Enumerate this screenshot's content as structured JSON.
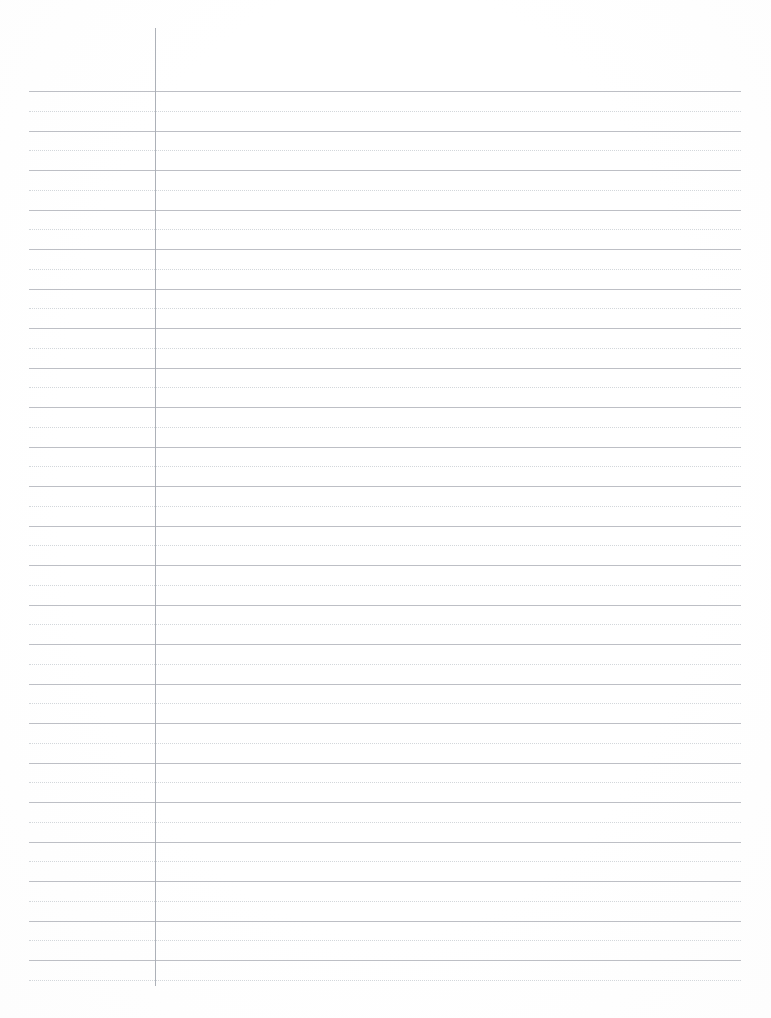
{
  "document": {
    "title": "Ruled Notebook Paper",
    "kind": "lined-paper",
    "page_width": 771,
    "page_height": 1018,
    "background_color": "#ffffff",
    "description": "Blank ruled writing paper with alternating solid baseline rules and dotted midline guides, plus a single vertical margin rule near the left edge.",
    "content_text": ""
  },
  "ruling": {
    "solid_line_color": "#b9bcc2",
    "dotted_line_color": "#cfd3d8",
    "margin_line_color": "#a9adb4",
    "line_left_x": 29,
    "line_right_x": 741,
    "line_width": 712,
    "first_solid_y": 91,
    "line_spacing": 39.5,
    "dotted_offset": 19.8,
    "solid_line_count": 23,
    "dotted_line_count": 23,
    "solid_line_thickness": 1,
    "dotted_line_thickness": 1
  },
  "margin_rule": {
    "x": 155,
    "top_y": 28,
    "bottom_y": 986,
    "height": 958,
    "thickness": 1
  }
}
